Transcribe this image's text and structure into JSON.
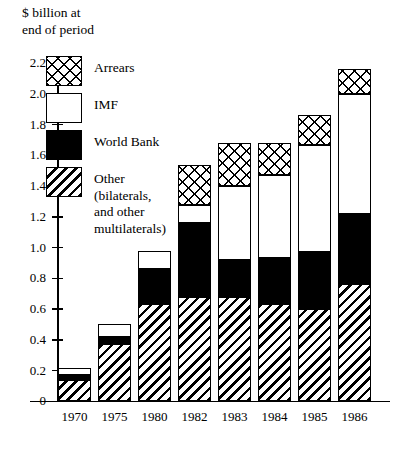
{
  "chart_data": {
    "type": "bar",
    "subtype": "stacked",
    "title": "$ billion at\nend of period",
    "xlabel": "",
    "ylabel": "$ billion at end of period",
    "ylim": [
      0,
      2.2
    ],
    "ytick_labels": [
      "0",
      "0.2",
      "0.4",
      "0.6",
      "0.8",
      "1.0",
      "1.2",
      "1.4",
      "1.6",
      "1.8",
      "2.0",
      "2.2"
    ],
    "ytick_values": [
      0,
      0.2,
      0.4,
      0.6,
      0.8,
      1.0,
      1.2,
      1.4,
      1.6,
      1.8,
      2.0,
      2.2
    ],
    "grid": false,
    "legend_position": "upper-left-inside",
    "categories": [
      "1970",
      "1975",
      "1980",
      "1982",
      "1983",
      "1984",
      "1985",
      "1986"
    ],
    "series": [
      {
        "name": "Other (bilaterals, and other multilaterals)",
        "key": "other",
        "pattern": "diagonal-hatch",
        "values": [
          0.14,
          0.37,
          0.63,
          0.68,
          0.68,
          0.63,
          0.6,
          0.76
        ]
      },
      {
        "name": "World Bank",
        "key": "world_bank",
        "pattern": "solid-black",
        "values": [
          0.03,
          0.05,
          0.23,
          0.48,
          0.24,
          0.3,
          0.37,
          0.46
        ]
      },
      {
        "name": "IMF",
        "key": "imf",
        "pattern": "white",
        "values": [
          0.05,
          0.08,
          0.12,
          0.12,
          0.48,
          0.54,
          0.7,
          0.78
        ]
      },
      {
        "name": "Arrears",
        "key": "arrears",
        "pattern": "cross-hatch",
        "values": [
          0.0,
          0.0,
          0.0,
          0.26,
          0.28,
          0.21,
          0.19,
          0.16
        ]
      }
    ],
    "totals": [
      0.22,
      0.5,
      0.98,
      1.54,
      1.68,
      1.68,
      1.86,
      2.16
    ],
    "cumulative_tops": {
      "other": [
        0.14,
        0.37,
        0.63,
        0.68,
        0.68,
        0.63,
        0.6,
        0.76
      ],
      "world_bank": [
        0.17,
        0.42,
        0.86,
        1.16,
        0.92,
        0.93,
        0.97,
        1.22
      ],
      "imf": [
        0.22,
        0.5,
        0.98,
        1.28,
        1.4,
        1.47,
        1.67,
        2.0
      ],
      "arrears": [
        0.22,
        0.5,
        0.98,
        1.54,
        1.68,
        1.68,
        1.86,
        2.16
      ]
    },
    "legend": [
      {
        "label": "Arrears",
        "key": "arrears"
      },
      {
        "label": "IMF",
        "key": "imf"
      },
      {
        "label": "World Bank",
        "key": "world_bank"
      },
      {
        "label": "Other\n(bilaterals,\nand other\nmultilaterals)",
        "key": "other"
      }
    ],
    "colors": {
      "ink": "#000000",
      "background": "#ffffff"
    }
  }
}
